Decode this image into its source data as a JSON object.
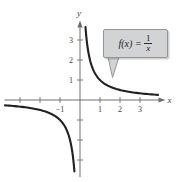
{
  "axes": {
    "x_label": "x",
    "y_label": "y"
  },
  "callout": {
    "function_lhs": "f(x)",
    "equals": "=",
    "numerator": "1",
    "denominator": "x"
  },
  "colors": {
    "curve": "#231f20",
    "axis": "#6d6e71",
    "tick_label": "#3f3f41",
    "callout_fill": "#d2d3d5",
    "callout_border": "#939598"
  },
  "chart_data": {
    "type": "line",
    "title": "",
    "annotation": "f(x) = 1/x",
    "xlabel": "x",
    "ylabel": "y",
    "x_range": [
      -3.9,
      4.3
    ],
    "y_range": [
      -4.1,
      4.0
    ],
    "grid": false,
    "legend": false,
    "origin_px": [
      80,
      100
    ],
    "px_per_unit": 20,
    "x_ticks": [
      {
        "v": -3,
        "label": ""
      },
      {
        "v": -2,
        "label": ""
      },
      {
        "v": -1,
        "label": "−1"
      },
      {
        "v": 1,
        "label": "1"
      },
      {
        "v": 2,
        "label": "2"
      },
      {
        "v": 3,
        "label": "3"
      }
    ],
    "y_ticks": [
      {
        "v": -3,
        "label": ""
      },
      {
        "v": -2,
        "label": ""
      },
      {
        "v": -1,
        "label": ""
      },
      {
        "v": 1,
        "label": "1"
      },
      {
        "v": 2,
        "label": "2"
      },
      {
        "v": 3,
        "label": "3"
      }
    ],
    "branches": [
      {
        "name": "negative-branch",
        "x_start": -3.75,
        "x_end": -0.28
      },
      {
        "name": "positive-branch",
        "x_start": 0.274,
        "x_end": 3.9
      }
    ],
    "key_points": [
      [
        -3,
        -0.33
      ],
      [
        -2,
        -0.5
      ],
      [
        -1,
        -1
      ],
      [
        1,
        1
      ],
      [
        2,
        0.5
      ],
      [
        3,
        0.33
      ]
    ]
  }
}
